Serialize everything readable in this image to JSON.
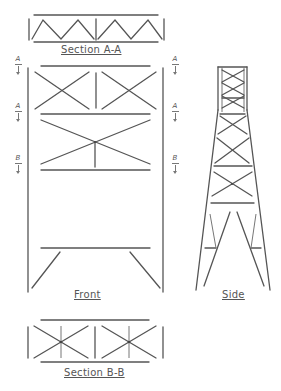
{
  "diagram": {
    "type": "engineering-drawing",
    "line_color": "#555555",
    "views": {
      "section_a": {
        "label": "Section A-A"
      },
      "front": {
        "label": "Front"
      },
      "side": {
        "label": "Side"
      },
      "section_b": {
        "label": "Section B-B"
      }
    },
    "section_markers": [
      {
        "id": "left-a-top",
        "letter": "A",
        "side": "left"
      },
      {
        "id": "left-a-mid",
        "letter": "A",
        "side": "left"
      },
      {
        "id": "left-b",
        "letter": "B",
        "side": "left"
      },
      {
        "id": "right-a-top",
        "letter": "A",
        "side": "right"
      },
      {
        "id": "right-a-mid",
        "letter": "A",
        "side": "right"
      },
      {
        "id": "right-b",
        "letter": "B",
        "side": "right"
      }
    ]
  }
}
